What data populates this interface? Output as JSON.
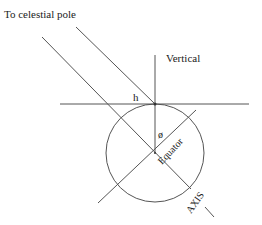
{
  "diagram": {
    "labels": {
      "celestial_pole": "To celestial pole",
      "vertical": "Vertical",
      "h": "h",
      "phi": "ø",
      "equator": "Equator",
      "axis": "AXIS"
    },
    "colors": {
      "line": "#555555",
      "text": "#222222",
      "background": "#ffffff"
    },
    "geometry": {
      "circle": {
        "cx": 155,
        "cy": 153,
        "r": 49
      },
      "tangent_point": {
        "x": 155,
        "y": 104
      }
    }
  }
}
